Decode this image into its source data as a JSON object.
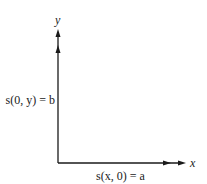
{
  "diagram": {
    "axes": {
      "x_label": "x",
      "y_label": "y"
    },
    "boundary_conditions": {
      "left": "s(0, y) = b",
      "bottom": "s(x, 0) = a"
    },
    "colors": {
      "line": "#1a1a1a",
      "text": "#222222",
      "background": "#ffffff"
    }
  }
}
